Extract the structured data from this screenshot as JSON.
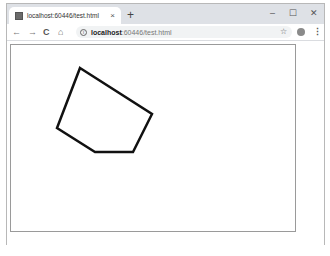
{
  "browser": {
    "tab": {
      "title": "localhost:60446/test.html",
      "close_glyph": "×",
      "favicon": "page-favicon"
    },
    "new_tab_glyph": "+",
    "window_controls": {
      "minimize": "–",
      "maximize": "☐",
      "close": "✕"
    },
    "nav": {
      "back": "←",
      "forward": "→",
      "reload": "C",
      "home": "⌂"
    },
    "address": {
      "info_glyph": "i",
      "host": "localhost",
      "path": ":60446/test.html"
    },
    "bookmark_glyph": "☆",
    "menu_glyph": "⋮"
  },
  "page": {
    "canvas": {
      "border_color": "#9a9a9a",
      "stroke_color": "#111111",
      "stroke_width": 2.5,
      "polygon_points": [
        [
          80,
          68
        ],
        [
          152,
          114
        ],
        [
          133,
          152
        ],
        [
          95,
          152
        ],
        [
          57,
          128
        ]
      ]
    }
  }
}
